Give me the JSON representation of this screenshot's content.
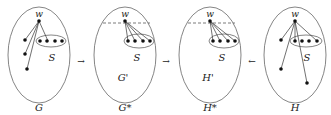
{
  "panels": [
    {
      "id": "G",
      "label": "G",
      "inner_label": "",
      "subset_label": "S",
      "vertex_label": "w",
      "has_dashed_cut": false
    },
    {
      "id": "Gstar",
      "label": "G*",
      "inner_label": "G'",
      "subset_label": "S",
      "vertex_label": "w",
      "has_dashed_cut": true
    },
    {
      "id": "Hstar",
      "label": "H*",
      "inner_label": "H'",
      "subset_label": "S",
      "vertex_label": "w",
      "has_dashed_cut": true
    },
    {
      "id": "H",
      "label": "H",
      "inner_label": "",
      "subset_label": "S",
      "vertex_label": "w",
      "has_dashed_cut": false
    }
  ],
  "arrows": [
    {
      "from": "G",
      "to": "Gstar",
      "glyph": "→"
    },
    {
      "from": "Gstar",
      "to": "Hstar",
      "glyph": "→"
    },
    {
      "from": "H",
      "to": "Hstar",
      "glyph": "←"
    }
  ],
  "colors": {
    "stroke": "#555555",
    "dot": "#111111",
    "text": "#222222"
  }
}
